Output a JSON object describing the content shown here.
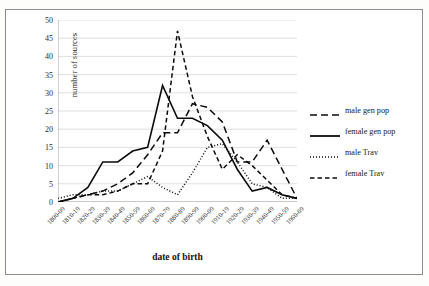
{
  "chart_data": {
    "type": "line",
    "title": "",
    "xlabel": "date of birth",
    "ylabel": "number of sources",
    "ylim": [
      0,
      50
    ],
    "ytick_step": 5,
    "yticks": [
      "0",
      "5",
      "10",
      "15",
      "20",
      "25",
      "30",
      "35",
      "40",
      "45",
      "50"
    ],
    "grid": "horizontal",
    "legend_position": "right",
    "categories": [
      "1800-09",
      "1810-19",
      "1820-29",
      "1830-39",
      "1840-49",
      "1850-59",
      "1860-69",
      "1870-79",
      "1880-89",
      "1890-99",
      "1900-09",
      "1910-19",
      "1920-29",
      "1930-39",
      "1940-49",
      "1950-59",
      "1960-69"
    ],
    "series": [
      {
        "name": "male gen pop",
        "style": "long-dash",
        "values": [
          0,
          1,
          2,
          3,
          5,
          8,
          13,
          19,
          19,
          27,
          26,
          22,
          11,
          11,
          17,
          9,
          1
        ]
      },
      {
        "name": "female gen pop",
        "style": "solid",
        "values": [
          0,
          1,
          4,
          11,
          11,
          14,
          15,
          32,
          23,
          23,
          21,
          17,
          9,
          3,
          4,
          2,
          1
        ]
      },
      {
        "name": "male Trav",
        "style": "dotted",
        "values": [
          1,
          2,
          2,
          3,
          3,
          5,
          7,
          4,
          2,
          8,
          15,
          16,
          11,
          5,
          4,
          1,
          1
        ]
      },
      {
        "name": "female Trav",
        "style": "dashed",
        "values": [
          0,
          1,
          2,
          2,
          3,
          5,
          5,
          14,
          47,
          29,
          18,
          9,
          13,
          10,
          6,
          2,
          1
        ]
      }
    ]
  },
  "legend": {
    "items": [
      {
        "label": "male gen pop"
      },
      {
        "label": "female gen pop"
      },
      {
        "label": "male Trav"
      },
      {
        "label": "female Trav"
      }
    ]
  }
}
